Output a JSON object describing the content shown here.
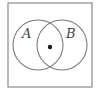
{
  "diagram": {
    "type": "venn",
    "universe_box": {
      "x": 8,
      "y": 3,
      "width": 84,
      "height": 84,
      "stroke": "#8a8a8a"
    },
    "sets": [
      {
        "label": "A",
        "cx": 38,
        "cy": 45,
        "r": 25,
        "label_x": 22,
        "label_y": 38
      },
      {
        "label": "B",
        "cx": 62,
        "cy": 45,
        "r": 25,
        "label_x": 66,
        "label_y": 38
      }
    ],
    "point": {
      "cx": 50,
      "cy": 47,
      "r": 2.2,
      "region": "A ∩ B"
    },
    "stroke_color": "#7a7a7a",
    "point_color": "#1a1a1a"
  }
}
